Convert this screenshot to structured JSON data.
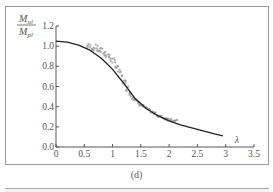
{
  "figure": {
    "caption": "(d)"
  },
  "chart_data": {
    "type": "line",
    "title": "",
    "xlabel": "λ",
    "ylabel_numerator": "M_ul",
    "ylabel_denominator": "M_pl",
    "ylabel_num_main": "M",
    "ylabel_num_sub": "ul",
    "ylabel_den_main": "M",
    "ylabel_den_sub": "pl",
    "xlim": [
      0,
      3.5
    ],
    "ylim": [
      0.0,
      1.2
    ],
    "x_ticks": [
      0,
      0.5,
      1,
      1.5,
      2,
      2.5,
      3,
      3.5
    ],
    "x_tick_labels": [
      "0",
      "0.5",
      "1",
      "1.5",
      "2",
      "2.5",
      "3",
      "3.5"
    ],
    "y_ticks": [
      0.0,
      0.2,
      0.4,
      0.6,
      0.8,
      1.0,
      1.2
    ],
    "y_tick_labels": [
      "0.0",
      "0.2",
      "0.4",
      "0.6",
      "0.8",
      "1.0",
      "1.2"
    ],
    "grid": false,
    "legend": null,
    "series": [
      {
        "name": "design curve",
        "style": "solid black line",
        "color": "#222222",
        "x": [
          0,
          0.2,
          0.4,
          0.6,
          0.8,
          1.0,
          1.2,
          1.4,
          1.6,
          1.8,
          2.0,
          2.2,
          2.4,
          2.6,
          2.8,
          2.95
        ],
        "y": [
          1.05,
          1.04,
          1.01,
          0.96,
          0.88,
          0.77,
          0.63,
          0.48,
          0.38,
          0.31,
          0.26,
          0.22,
          0.19,
          0.16,
          0.13,
          0.11
        ]
      },
      {
        "name": "test / numerical data",
        "style": "grey scatter band",
        "color": "#999999",
        "x": [
          0.55,
          0.65,
          0.75,
          0.85,
          0.95,
          1.05,
          1.15,
          1.25,
          1.35,
          1.45,
          1.55,
          1.65,
          1.75,
          1.85,
          1.95,
          2.05,
          2.15
        ],
        "y": [
          1.0,
          0.99,
          0.97,
          0.94,
          0.89,
          0.82,
          0.72,
          0.6,
          0.5,
          0.44,
          0.4,
          0.36,
          0.33,
          0.3,
          0.28,
          0.27,
          0.25
        ]
      }
    ]
  }
}
